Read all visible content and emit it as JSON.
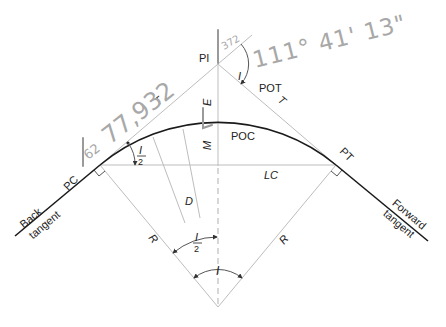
{
  "diagram": {
    "labels": {
      "pi": "PI",
      "i_at_pi": "I",
      "pot": "POT",
      "t_back": "T",
      "t_forward": "T",
      "e": "E",
      "m": "M",
      "poc": "POC",
      "pc": "PC",
      "pt": "PT",
      "lc": "LC",
      "d": "D",
      "r_left": "R",
      "r_right": "R",
      "half_i_pc": {
        "num": "I",
        "den": "2"
      },
      "half_i_center": {
        "num": "I",
        "den": "2"
      },
      "i_center": "I",
      "back_tangent": {
        "line1": "Back",
        "line2": "tangent"
      },
      "forward_tangent": {
        "line1": "Forward",
        "line2": "tangent"
      }
    },
    "handwritten": {
      "deflection_angle": "111° 41' 13\"",
      "tangent_length": "77,932",
      "pc_note": "62",
      "pi_note": "372"
    },
    "colors": {
      "curve": "#1a1a1a",
      "construction": "#bdbdbd",
      "pencil": "#a8a8a8"
    }
  }
}
